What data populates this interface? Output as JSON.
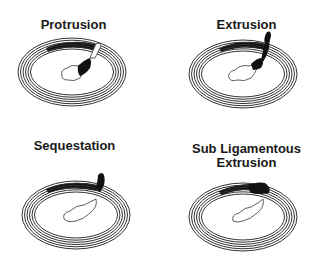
{
  "figure": {
    "panels": [
      {
        "id": "protrusion",
        "title": "Protrusion"
      },
      {
        "id": "extrusion",
        "title": "Extrusion"
      },
      {
        "id": "sequestation",
        "title": "Sequestation"
      },
      {
        "id": "sub-ligamentous-extrusion",
        "title_line1": "Sub Ligamentous",
        "title_line2": "Extrusion"
      }
    ]
  }
}
